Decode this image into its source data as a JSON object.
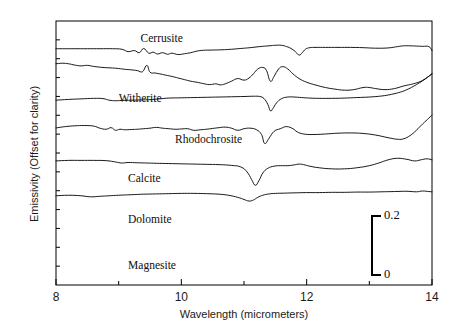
{
  "chart_data": {
    "type": "line",
    "title": "",
    "xlabel": "Wavelength (micrometers)",
    "ylabel": "Emissivity (Offset for clarity)",
    "xlim": [
      8,
      14
    ],
    "ylim": [
      0,
      1
    ],
    "xticks_major": [
      8,
      10,
      12,
      14
    ],
    "xticks_minor": [
      9,
      11,
      13
    ],
    "xtick_labels": [
      "8",
      "10",
      "12",
      "14"
    ],
    "yticks_labeled": false,
    "grid": false,
    "legend_position": "inline-curve-labels",
    "scale_bar": {
      "top_label": "0.2",
      "bottom_label": "0",
      "value_top": 0.2,
      "value_bottom": 0,
      "units": "emissivity"
    },
    "series": [
      {
        "name": "Cerrusite",
        "label": "Cerrusite",
        "offset_index": 0,
        "absorption_minima": [
          11.9
        ],
        "x": [
          8.0,
          8.15,
          8.3,
          8.5,
          8.7,
          8.9,
          9.05,
          9.15,
          9.25,
          9.33,
          9.4,
          9.48,
          9.55,
          9.62,
          9.7,
          9.78,
          9.85,
          9.95,
          10.05,
          10.15,
          10.25,
          10.35,
          10.5,
          10.65,
          10.8,
          10.95,
          11.1,
          11.25,
          11.4,
          11.5,
          11.6,
          11.68,
          11.75,
          11.82,
          11.88,
          11.93,
          11.98,
          12.05,
          12.15,
          12.3,
          12.5,
          12.7,
          12.9,
          13.1,
          13.3,
          13.45,
          13.55,
          13.65,
          13.75,
          13.85,
          13.95,
          14.0
        ],
        "y": [
          0.895,
          0.895,
          0.895,
          0.895,
          0.895,
          0.895,
          0.893,
          0.884,
          0.888,
          0.88,
          0.896,
          0.878,
          0.882,
          0.875,
          0.88,
          0.874,
          0.878,
          0.873,
          0.876,
          0.88,
          0.886,
          0.889,
          0.89,
          0.891,
          0.893,
          0.896,
          0.899,
          0.903,
          0.906,
          0.908,
          0.908,
          0.903,
          0.896,
          0.884,
          0.871,
          0.88,
          0.893,
          0.899,
          0.9,
          0.9,
          0.9,
          0.9,
          0.899,
          0.897,
          0.898,
          0.903,
          0.906,
          0.906,
          0.905,
          0.904,
          0.903,
          0.888
        ]
      },
      {
        "name": "Witherite",
        "label": "Witherite",
        "offset_index": 1,
        "absorption_minima": [
          11.42,
          12.6
        ],
        "emission_maxima": [
          11.25,
          11.62
        ],
        "x": [
          8.0,
          8.1,
          8.2,
          8.3,
          8.4,
          8.5,
          8.6,
          8.75,
          8.9,
          9.0,
          9.1,
          9.2,
          9.3,
          9.38,
          9.45,
          9.5,
          9.58,
          9.65,
          9.75,
          9.85,
          9.95,
          10.05,
          10.15,
          10.25,
          10.35,
          10.45,
          10.55,
          10.62,
          10.7,
          10.8,
          10.9,
          11.0,
          11.08,
          11.15,
          11.22,
          11.3,
          11.36,
          11.42,
          11.48,
          11.55,
          11.62,
          11.7,
          11.78,
          11.88,
          12.0,
          12.15,
          12.3,
          12.45,
          12.6,
          12.75,
          12.9,
          13.0,
          13.1,
          13.25,
          13.4,
          13.55,
          13.7,
          13.85,
          14.0
        ],
        "y": [
          0.838,
          0.84,
          0.838,
          0.833,
          0.83,
          0.832,
          0.828,
          0.824,
          0.822,
          0.82,
          0.817,
          0.815,
          0.812,
          0.808,
          0.832,
          0.806,
          0.803,
          0.8,
          0.795,
          0.79,
          0.784,
          0.778,
          0.772,
          0.768,
          0.763,
          0.759,
          0.762,
          0.758,
          0.762,
          0.772,
          0.782,
          0.776,
          0.784,
          0.8,
          0.818,
          0.824,
          0.812,
          0.772,
          0.79,
          0.818,
          0.827,
          0.818,
          0.8,
          0.782,
          0.768,
          0.757,
          0.748,
          0.742,
          0.738,
          0.74,
          0.748,
          0.748,
          0.744,
          0.74,
          0.744,
          0.754,
          0.762,
          0.775,
          0.8
        ]
      },
      {
        "name": "Rhodochrosite",
        "label": "Rhodochrosite",
        "offset_index": 2,
        "absorption_minima": [
          11.42
        ],
        "x": [
          8.0,
          8.2,
          8.4,
          8.6,
          8.75,
          8.85,
          8.95,
          9.05,
          9.2,
          9.35,
          9.5,
          9.65,
          9.8,
          10.0,
          10.2,
          10.4,
          10.6,
          10.8,
          11.0,
          11.15,
          11.25,
          11.32,
          11.38,
          11.42,
          11.46,
          11.52,
          11.6,
          11.7,
          11.8,
          11.92,
          12.05,
          12.2,
          12.4,
          12.6,
          12.8,
          13.0,
          13.2,
          13.35,
          13.5,
          13.6,
          13.7,
          13.8,
          13.9,
          14.0
        ],
        "y": [
          0.7,
          0.703,
          0.705,
          0.707,
          0.706,
          0.7,
          0.698,
          0.699,
          0.7,
          0.701,
          0.702,
          0.705,
          0.708,
          0.709,
          0.71,
          0.711,
          0.712,
          0.713,
          0.714,
          0.715,
          0.714,
          0.706,
          0.684,
          0.66,
          0.668,
          0.69,
          0.706,
          0.712,
          0.712,
          0.71,
          0.708,
          0.707,
          0.707,
          0.708,
          0.71,
          0.712,
          0.716,
          0.722,
          0.731,
          0.74,
          0.752,
          0.766,
          0.782,
          0.8
        ]
      },
      {
        "name": "Calcite",
        "label": "Calcite",
        "offset_index": 3,
        "absorption_minima": [
          11.33
        ],
        "x": [
          8.0,
          8.15,
          8.3,
          8.45,
          8.6,
          8.7,
          8.8,
          8.88,
          8.95,
          9.02,
          9.1,
          9.2,
          9.3,
          9.4,
          9.5,
          9.6,
          9.7,
          9.8,
          9.9,
          10.0,
          10.1,
          10.2,
          10.3,
          10.4,
          10.5,
          10.6,
          10.7,
          10.8,
          10.9,
          11.0,
          11.1,
          11.2,
          11.28,
          11.33,
          11.4,
          11.48,
          11.58,
          11.68,
          11.78,
          11.85,
          11.95,
          12.1,
          12.3,
          12.5,
          12.7,
          12.9,
          13.1,
          13.3,
          13.45,
          13.55,
          13.65,
          13.75,
          13.85,
          13.95,
          14.0
        ],
        "y": [
          0.595,
          0.6,
          0.603,
          0.604,
          0.602,
          0.594,
          0.59,
          0.596,
          0.586,
          0.59,
          0.588,
          0.589,
          0.59,
          0.592,
          0.594,
          0.597,
          0.594,
          0.592,
          0.59,
          0.591,
          0.592,
          0.586,
          0.588,
          0.59,
          0.593,
          0.596,
          0.598,
          0.594,
          0.586,
          0.592,
          0.594,
          0.588,
          0.57,
          0.536,
          0.556,
          0.582,
          0.592,
          0.6,
          0.592,
          0.58,
          0.572,
          0.57,
          0.572,
          0.575,
          0.576,
          0.574,
          0.568,
          0.558,
          0.552,
          0.554,
          0.566,
          0.586,
          0.61,
          0.632,
          0.644
        ]
      },
      {
        "name": "Dolomite",
        "label": "Dolomite",
        "offset_index": 4,
        "absorption_minima": [
          11.18
        ],
        "x": [
          8.0,
          8.2,
          8.4,
          8.6,
          8.8,
          8.95,
          9.05,
          9.15,
          9.3,
          9.45,
          9.6,
          9.8,
          10.0,
          10.2,
          10.4,
          10.6,
          10.8,
          10.95,
          11.05,
          11.12,
          11.18,
          11.24,
          11.3,
          11.38,
          11.48,
          11.58,
          11.7,
          11.8,
          11.88,
          11.95,
          12.05,
          12.2,
          12.4,
          12.6,
          12.8,
          13.0,
          13.15,
          13.3,
          13.45,
          13.6,
          13.72,
          13.82,
          13.92,
          14.0
        ],
        "y": [
          0.47,
          0.472,
          0.472,
          0.472,
          0.471,
          0.466,
          0.462,
          0.464,
          0.463,
          0.462,
          0.461,
          0.46,
          0.459,
          0.458,
          0.457,
          0.456,
          0.453,
          0.447,
          0.428,
          0.4,
          0.378,
          0.396,
          0.424,
          0.442,
          0.45,
          0.452,
          0.452,
          0.455,
          0.458,
          0.456,
          0.45,
          0.444,
          0.44,
          0.44,
          0.444,
          0.452,
          0.462,
          0.474,
          0.48,
          0.476,
          0.47,
          0.474,
          0.478,
          0.474
        ]
      },
      {
        "name": "Magnesite",
        "label": "Magnesite",
        "offset_index": 5,
        "absorption_minima": [
          11.08
        ],
        "x": [
          8.0,
          8.2,
          8.4,
          8.55,
          8.7,
          8.85,
          9.0,
          9.2,
          9.4,
          9.6,
          9.8,
          10.0,
          10.2,
          10.4,
          10.6,
          10.75,
          10.9,
          11.0,
          11.08,
          11.15,
          11.22,
          11.3,
          11.4,
          11.5,
          11.65,
          11.8,
          12.0,
          12.2,
          12.4,
          12.6,
          12.8,
          13.0,
          13.2,
          13.4,
          13.6,
          13.75,
          13.85,
          13.95,
          14.0
        ],
        "y": [
          0.338,
          0.34,
          0.338,
          0.334,
          0.336,
          0.338,
          0.34,
          0.342,
          0.344,
          0.345,
          0.346,
          0.347,
          0.347,
          0.346,
          0.344,
          0.34,
          0.332,
          0.324,
          0.318,
          0.322,
          0.332,
          0.34,
          0.345,
          0.347,
          0.348,
          0.349,
          0.35,
          0.35,
          0.351,
          0.351,
          0.352,
          0.352,
          0.353,
          0.354,
          0.355,
          0.353,
          0.356,
          0.354,
          0.353
        ]
      }
    ],
    "curve_label_positions": [
      {
        "name": "Cerrusite",
        "x": 9.35,
        "y_px": 32
      },
      {
        "name": "Witherite",
        "x": 9.0,
        "y_px": 92
      },
      {
        "name": "Rhodochrosite",
        "x": 9.9,
        "y_px": 133
      },
      {
        "name": "Calcite",
        "x": 9.15,
        "y_px": 172
      },
      {
        "name": "Dolomite",
        "x": 9.15,
        "y_px": 213
      },
      {
        "name": "Magnesite",
        "x": 9.15,
        "y_px": 259
      }
    ],
    "colors": {
      "curve": "#000000",
      "axis": "#000000",
      "text": "#0d0d0d",
      "background": "#ffffff"
    }
  },
  "axes": {
    "x_tick_labels": [
      "8",
      "10",
      "12",
      "14"
    ],
    "x_axis_title": "Wavelength (micrometers)",
    "y_axis_title": "Emissivity (Offset for clarity)"
  },
  "scale_bar": {
    "top": "0.2",
    "bottom": "0"
  },
  "labels": {
    "cerrusite": "Cerrusite",
    "witherite": "Witherite",
    "rhodochrosite": "Rhodochrosite",
    "calcite": "Calcite",
    "dolomite": "Dolomite",
    "magnesite": "Magnesite"
  },
  "caption_sliver": ""
}
